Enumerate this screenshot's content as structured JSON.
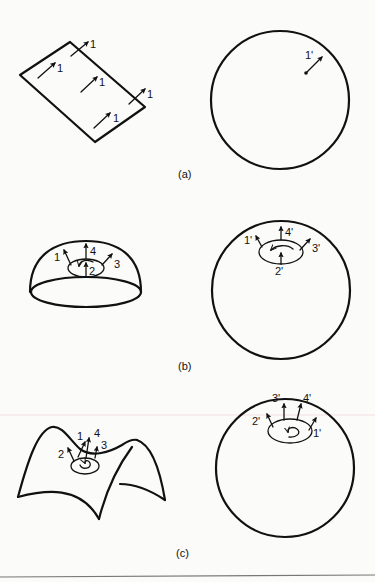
{
  "figure": {
    "panels": [
      {
        "id": "a",
        "caption": "(a)",
        "surface": "plane",
        "surface_vector_labels": [
          "1",
          "1",
          "1",
          "1",
          "1"
        ],
        "sphere_vector_labels": [
          "1'"
        ]
      },
      {
        "id": "b",
        "caption": "(b)",
        "surface": "hemisphere",
        "surface_vector_labels": [
          "1",
          "4",
          "2",
          "3"
        ],
        "sphere_vector_labels": [
          "1'",
          "4'",
          "3'",
          "2'"
        ],
        "loop_direction": "counterclockwise"
      },
      {
        "id": "c",
        "caption": "(c)",
        "surface": "saddle",
        "surface_vector_labels": [
          "1",
          "4",
          "3",
          "2"
        ],
        "sphere_vector_labels": [
          "3'",
          "4'",
          "2'",
          "1'"
        ],
        "loop_direction": "clockwise"
      }
    ]
  }
}
